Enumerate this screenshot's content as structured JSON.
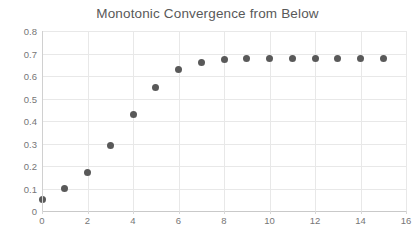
{
  "chart_data": {
    "type": "scatter",
    "title": "Monotonic Convergence from Below",
    "subtitle": "",
    "xlabel": "",
    "ylabel": "",
    "xlim": [
      0,
      16
    ],
    "ylim": [
      0,
      0.8
    ],
    "xticks": [
      "0",
      "2",
      "4",
      "6",
      "8",
      "10",
      "12",
      "14",
      "16"
    ],
    "xtick_values": [
      0,
      2,
      4,
      6,
      8,
      10,
      12,
      14,
      16
    ],
    "yticks": [
      "0",
      "0.1",
      "0.2",
      "0.3",
      "0.4",
      "0.5",
      "0.6",
      "0.7",
      "0.8"
    ],
    "ytick_values": [
      0,
      0.1,
      0.2,
      0.3,
      0.4,
      0.5,
      0.6,
      0.7,
      0.8
    ],
    "grid": true,
    "legend": false,
    "legend_position": "none",
    "marker_color": "#595959",
    "marker_shape": "circle",
    "x": [
      0,
      1,
      2,
      3,
      4,
      5,
      6,
      7,
      8,
      9,
      10,
      11,
      12,
      13,
      14,
      15
    ],
    "values": [
      0.049,
      0.098,
      0.169,
      0.289,
      0.427,
      0.551,
      0.627,
      0.662,
      0.675,
      0.678,
      0.679,
      0.679,
      0.679,
      0.679,
      0.679,
      0.679
    ],
    "series": [
      {
        "name": "iterate",
        "x": [
          0,
          1,
          2,
          3,
          4,
          5,
          6,
          7,
          8,
          9,
          10,
          11,
          12,
          13,
          14,
          15
        ],
        "values": [
          0.049,
          0.098,
          0.169,
          0.289,
          0.427,
          0.551,
          0.627,
          0.662,
          0.675,
          0.678,
          0.679,
          0.679,
          0.679,
          0.679,
          0.679,
          0.679
        ]
      }
    ],
    "annotations": []
  }
}
